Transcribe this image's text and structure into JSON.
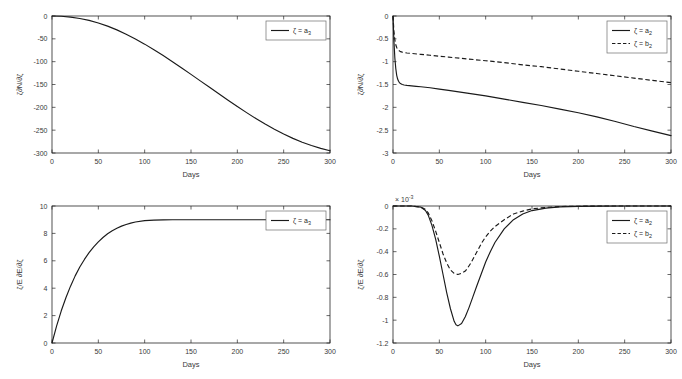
{
  "figure": {
    "background": "#ffffff",
    "curve_color": "#1a1a1a",
    "axis_color": "#262626",
    "layout": "2x2 subplot grid"
  },
  "chart_data": [
    {
      "id": "top-left",
      "type": "line",
      "title": "",
      "xlabel": "Days",
      "ylabel": "ζ∂N/∂ζ",
      "xlim": [
        0,
        300
      ],
      "ylim": [
        -300,
        0
      ],
      "xticks": [
        0,
        50,
        100,
        150,
        200,
        250,
        300
      ],
      "yticks": [
        0,
        -50,
        -100,
        -150,
        -200,
        -250,
        -300
      ],
      "xticklabels": [
        "0",
        "50",
        "100",
        "150",
        "200",
        "250",
        "300"
      ],
      "yticklabels": [
        "0",
        "-50",
        "-100",
        "-150",
        "-200",
        "-250",
        "-300"
      ],
      "grid": false,
      "legend_position": "upper right",
      "exponent_label": "",
      "series": [
        {
          "name": "ζ = a",
          "name_sub": "3",
          "style": "solid",
          "x": [
            0,
            10,
            20,
            30,
            40,
            50,
            60,
            70,
            80,
            90,
            100,
            110,
            120,
            130,
            140,
            150,
            160,
            170,
            180,
            190,
            200,
            210,
            220,
            230,
            240,
            250,
            260,
            270,
            280,
            290,
            300
          ],
          "values": [
            0,
            -0.6,
            -2.4,
            -5.4,
            -9.6,
            -15.2,
            -22.2,
            -30.4,
            -39.8,
            -50.2,
            -61.6,
            -73.8,
            -86.6,
            -100,
            -113.8,
            -127.8,
            -142,
            -156.2,
            -170.4,
            -184.4,
            -198.2,
            -211.6,
            -224.4,
            -236.6,
            -248,
            -258.6,
            -268,
            -276.4,
            -283.6,
            -289.8,
            -295
          ]
        }
      ]
    },
    {
      "id": "top-right",
      "type": "line",
      "title": "",
      "xlabel": "Days",
      "ylabel": "ζ∂N/∂ζ",
      "xlim": [
        0,
        300
      ],
      "ylim": [
        -3,
        0
      ],
      "xticks": [
        0,
        50,
        100,
        150,
        200,
        250,
        300
      ],
      "yticks": [
        0,
        -0.5,
        -1,
        -1.5,
        -2,
        -2.5,
        -3
      ],
      "xticklabels": [
        "0",
        "50",
        "100",
        "150",
        "200",
        "250",
        "300"
      ],
      "yticklabels": [
        "0",
        "-0.5",
        "-1",
        "-1.5",
        "-2",
        "-2.5",
        "-3"
      ],
      "grid": false,
      "legend_position": "upper right",
      "exponent_label": "",
      "series": [
        {
          "name": "ζ = a",
          "name_sub": "2",
          "style": "solid",
          "x": [
            0,
            1,
            2,
            3,
            4,
            5,
            6,
            7,
            8,
            10,
            12,
            15,
            20,
            25,
            30,
            40,
            50,
            60,
            80,
            100,
            120,
            140,
            160,
            180,
            200,
            220,
            240,
            260,
            280,
            300
          ],
          "values": [
            0,
            -0.55,
            -0.92,
            -1.15,
            -1.3,
            -1.38,
            -1.43,
            -1.46,
            -1.48,
            -1.5,
            -1.51,
            -1.52,
            -1.53,
            -1.54,
            -1.55,
            -1.57,
            -1.6,
            -1.63,
            -1.69,
            -1.75,
            -1.82,
            -1.89,
            -1.96,
            -2.04,
            -2.12,
            -2.21,
            -2.31,
            -2.42,
            -2.52,
            -2.62
          ]
        },
        {
          "name": "ζ = b",
          "name_sub": "2",
          "style": "dashed",
          "x": [
            0,
            1,
            2,
            3,
            4,
            5,
            6,
            8,
            10,
            15,
            20,
            30,
            40,
            50,
            60,
            80,
            100,
            120,
            140,
            160,
            180,
            200,
            220,
            240,
            260,
            280,
            300
          ],
          "values": [
            0,
            -0.34,
            -0.52,
            -0.63,
            -0.69,
            -0.73,
            -0.75,
            -0.78,
            -0.79,
            -0.81,
            -0.82,
            -0.84,
            -0.86,
            -0.88,
            -0.9,
            -0.94,
            -0.98,
            -1.02,
            -1.07,
            -1.11,
            -1.16,
            -1.21,
            -1.26,
            -1.31,
            -1.36,
            -1.41,
            -1.46
          ]
        }
      ]
    },
    {
      "id": "bottom-left",
      "type": "line",
      "title": "",
      "xlabel": "Days",
      "ylabel": "ζ/E ∂E/∂ζ",
      "xlim": [
        0,
        300
      ],
      "ylim": [
        0,
        10
      ],
      "xticks": [
        0,
        50,
        100,
        150,
        200,
        250,
        300
      ],
      "yticks": [
        0,
        2,
        4,
        6,
        8,
        10
      ],
      "xticklabels": [
        "0",
        "50",
        "100",
        "150",
        "200",
        "250",
        "300"
      ],
      "yticklabels": [
        "0",
        "2",
        "4",
        "6",
        "8",
        "10"
      ],
      "grid": false,
      "legend_position": "upper right",
      "exponent_label": "",
      "series": [
        {
          "name": "ζ = a",
          "name_sub": "3",
          "style": "solid",
          "x": [
            0,
            5,
            10,
            15,
            20,
            25,
            30,
            35,
            40,
            45,
            50,
            55,
            60,
            65,
            70,
            75,
            80,
            85,
            90,
            100,
            110,
            120,
            130,
            140,
            150,
            175,
            200,
            225,
            250,
            275,
            300
          ],
          "values": [
            0,
            1.25,
            2.35,
            3.3,
            4.15,
            4.9,
            5.55,
            6.1,
            6.6,
            7.02,
            7.38,
            7.7,
            7.97,
            8.2,
            8.38,
            8.53,
            8.65,
            8.75,
            8.83,
            8.93,
            8.97,
            8.99,
            9.0,
            9.0,
            9.0,
            9.0,
            9.0,
            9.0,
            9.0,
            9.0,
            9.0
          ]
        }
      ]
    },
    {
      "id": "bottom-right",
      "type": "line",
      "title": "",
      "xlabel": "Days",
      "ylabel": "ζ/E ∂E/∂ζ",
      "xlim": [
        0,
        300
      ],
      "ylim": [
        -1.2,
        0
      ],
      "xticks": [
        0,
        50,
        100,
        150,
        200,
        250,
        300
      ],
      "yticks": [
        0,
        -0.2,
        -0.4,
        -0.6,
        -0.8,
        -1,
        -1.2
      ],
      "xticklabels": [
        "0",
        "50",
        "100",
        "150",
        "200",
        "250",
        "300"
      ],
      "yticklabels": [
        "0",
        "-0.2",
        "-0.4",
        "-0.6",
        "-0.8",
        "-1",
        "-1.2"
      ],
      "grid": false,
      "legend_position": "upper right",
      "exponent_label": "× 10",
      "exponent_sup": "-3",
      "series": [
        {
          "name": "ζ = a",
          "name_sub": "2",
          "style": "solid",
          "x": [
            0,
            20,
            30,
            35,
            38,
            42,
            46,
            50,
            54,
            58,
            62,
            66,
            68,
            70,
            74,
            78,
            82,
            86,
            90,
            95,
            100,
            105,
            110,
            120,
            130,
            140,
            150,
            165,
            180,
            200,
            225,
            250,
            275,
            300
          ],
          "values": [
            0,
            0,
            -0.01,
            -0.04,
            -0.08,
            -0.17,
            -0.29,
            -0.44,
            -0.6,
            -0.76,
            -0.9,
            -1.01,
            -1.04,
            -1.05,
            -1.03,
            -0.97,
            -0.89,
            -0.8,
            -0.71,
            -0.6,
            -0.49,
            -0.4,
            -0.32,
            -0.2,
            -0.12,
            -0.07,
            -0.04,
            -0.018,
            -0.008,
            -0.003,
            -0.001,
            0,
            0,
            0
          ]
        },
        {
          "name": "ζ = b",
          "name_sub": "2",
          "style": "dashed",
          "x": [
            0,
            20,
            30,
            35,
            38,
            42,
            46,
            50,
            54,
            58,
            62,
            66,
            70,
            74,
            78,
            80,
            84,
            88,
            92,
            96,
            100,
            105,
            110,
            120,
            130,
            140,
            150,
            165,
            180,
            200,
            225,
            250,
            275,
            300
          ],
          "values": [
            0,
            0,
            -0.01,
            -0.03,
            -0.06,
            -0.13,
            -0.22,
            -0.32,
            -0.42,
            -0.5,
            -0.56,
            -0.59,
            -0.6,
            -0.59,
            -0.57,
            -0.55,
            -0.5,
            -0.44,
            -0.38,
            -0.32,
            -0.27,
            -0.22,
            -0.18,
            -0.12,
            -0.07,
            -0.045,
            -0.025,
            -0.012,
            -0.005,
            -0.002,
            0,
            0,
            0,
            0
          ]
        }
      ]
    }
  ]
}
